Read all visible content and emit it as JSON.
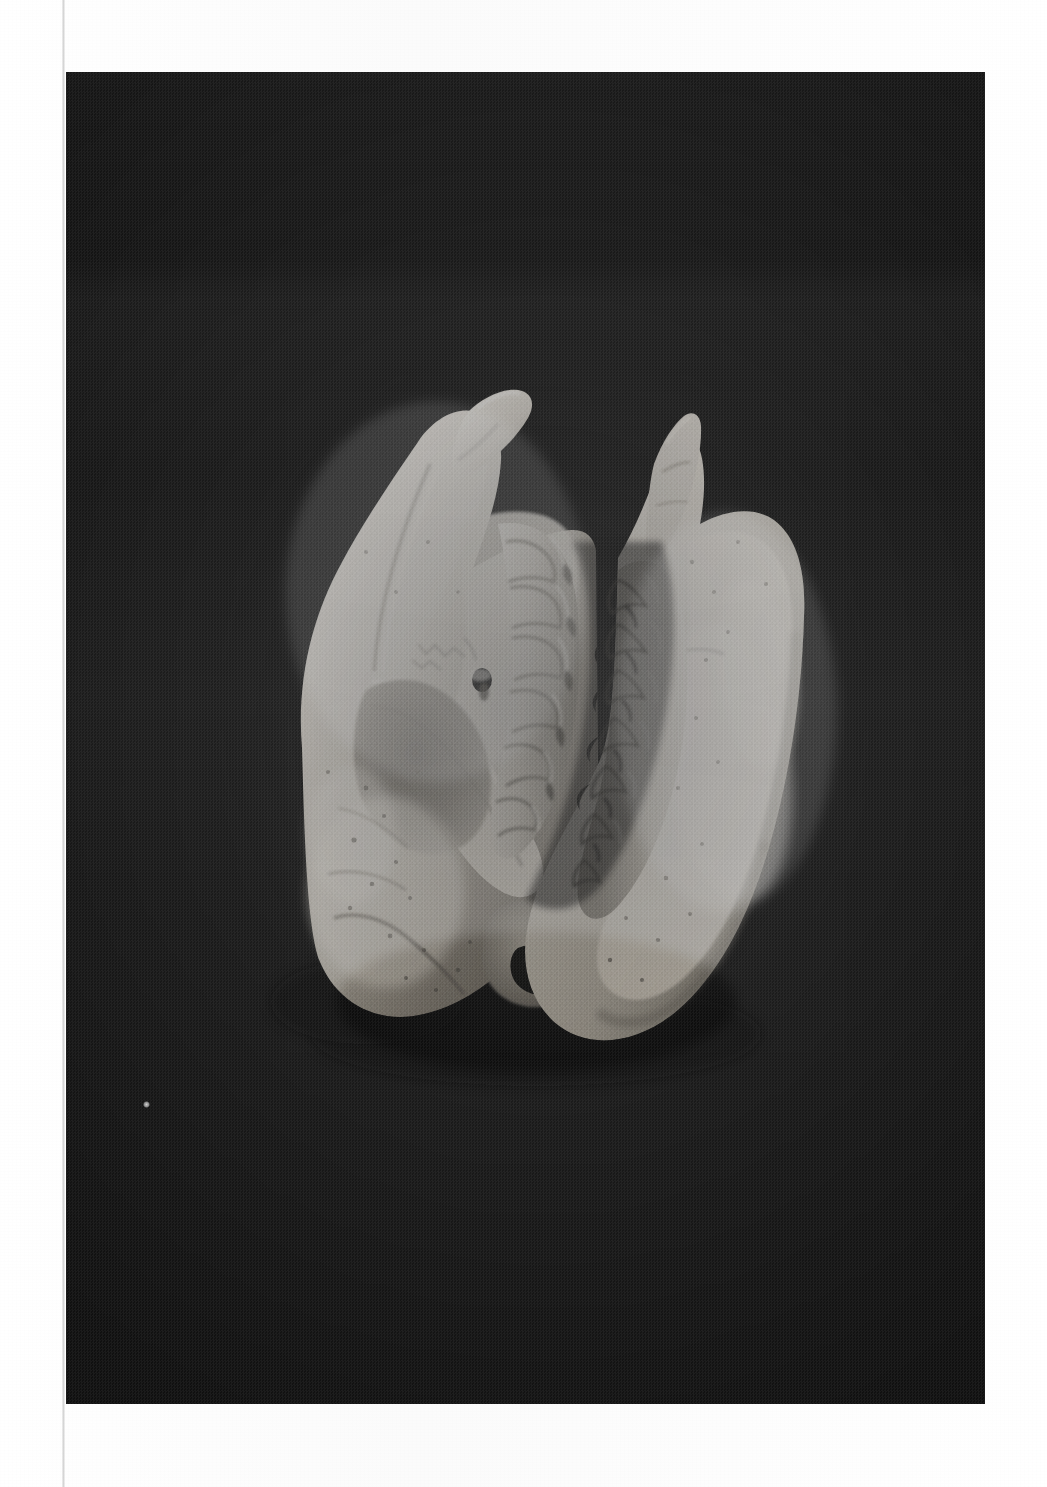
{
  "page": {
    "medium": "photographic plate on white paper",
    "paper_color": "#fdfdfd",
    "plate_background_color": "#1b1b1b",
    "bone_highlight_color": "#e8e4dc",
    "bone_midtone_color": "#bdb8ae",
    "bone_shadow_color": "#6e6a64",
    "plate_rect": {
      "x": 66,
      "y": 72,
      "width": 919,
      "height": 1332
    },
    "orientation": "portrait",
    "text_present": false,
    "caption": ""
  },
  "photograph": {
    "subject": "rodent skull specimen",
    "view": "oblique lateral / ventro-lateral with mandible articulated open",
    "lighting": "single soft key light from upper left",
    "background": "matte black cloth",
    "grain": "coarse halftone screen"
  },
  "specimen": {
    "label": "skull-with-mandible",
    "parts": [
      {
        "id": "cranium",
        "name": "Cranium",
        "side": "left"
      },
      {
        "id": "upper-incisor",
        "name": "Upper incisor",
        "side": "top-left"
      },
      {
        "id": "upper-tooth-row",
        "name": "Upper cheek tooth row",
        "side": "center-left"
      },
      {
        "id": "zygomatic-arch",
        "name": "Zygomatic arch",
        "side": "left"
      },
      {
        "id": "orbit",
        "name": "Orbit",
        "side": "left"
      },
      {
        "id": "infraorbital-foramen",
        "name": "Infraorbital foramen",
        "side": "left"
      },
      {
        "id": "auditory-bulla",
        "name": "Auditory bulla",
        "side": "lower-center"
      },
      {
        "id": "occipital-region",
        "name": "Occipital region",
        "side": "lower-left"
      },
      {
        "id": "mandible",
        "name": "Mandible (hemimandible)",
        "side": "right"
      },
      {
        "id": "coronoid-process",
        "name": "Coronoid process",
        "side": "upper-right"
      },
      {
        "id": "lower-tooth-row",
        "name": "Lower cheek tooth row",
        "side": "center-right"
      },
      {
        "id": "angular-process",
        "name": "Angular process",
        "side": "lower-right"
      },
      {
        "id": "masseteric-fossa",
        "name": "Masseteric fossa",
        "side": "right"
      }
    ],
    "tooth_count_upper": 4,
    "tooth_count_lower": 4,
    "bounding_box": {
      "x": 295,
      "y": 370,
      "width": 485,
      "height": 665
    }
  },
  "artifacts": {
    "dust_speck": {
      "x": 143,
      "y": 1101,
      "size": 7,
      "color": "#cfcfcf"
    },
    "scan_gutter_line_x": 62
  }
}
